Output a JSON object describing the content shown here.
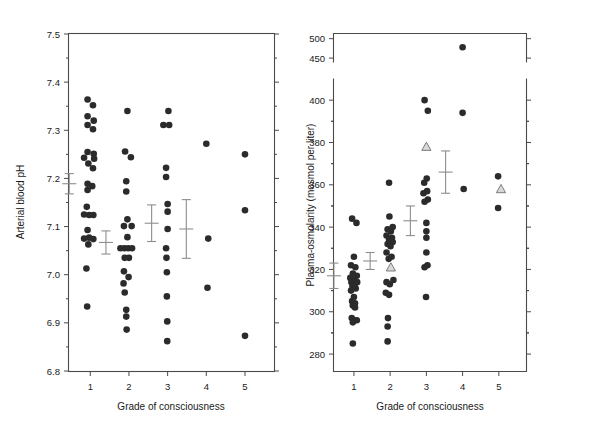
{
  "figure": {
    "caption": "",
    "panels": [
      "ph",
      "osmolarity"
    ]
  },
  "chart_data": [
    {
      "type": "scatter",
      "id": "ph",
      "title": "",
      "xlabel": "Grade of consciousness",
      "ylabel": "Arterial blood pH",
      "xlim": [
        0.45,
        5.75
      ],
      "ylim": [
        6.8,
        7.5
      ],
      "yticks": [
        6.8,
        6.9,
        7.0,
        7.1,
        7.2,
        7.3,
        7.4,
        7.5
      ],
      "ytick_labels": [
        "6.8",
        "6.9",
        "7.0",
        "7.1",
        "7.2",
        "7.3",
        "7.4",
        "7.5"
      ],
      "xticks": [
        1,
        2,
        3,
        4,
        5
      ],
      "xtick_labels": [
        "1",
        "2",
        "3",
        "4",
        "5"
      ],
      "grid": false,
      "legend": "none",
      "series": [
        {
          "name": "Grade 1",
          "marker": "filled-circle",
          "x": 1,
          "points": [
            {
              "x": 0.93,
              "y": 7.364
            },
            {
              "x": 1.07,
              "y": 7.352
            },
            {
              "x": 0.93,
              "y": 7.329
            },
            {
              "x": 1.09,
              "y": 7.32
            },
            {
              "x": 0.93,
              "y": 7.311
            },
            {
              "x": 1.07,
              "y": 7.302
            },
            {
              "x": 0.93,
              "y": 7.255
            },
            {
              "x": 1.09,
              "y": 7.251
            },
            {
              "x": 0.84,
              "y": 7.243
            },
            {
              "x": 1.1,
              "y": 7.241
            },
            {
              "x": 0.95,
              "y": 7.231
            },
            {
              "x": 1.07,
              "y": 7.221
            },
            {
              "x": 0.93,
              "y": 7.189
            },
            {
              "x": 1.05,
              "y": 7.184
            },
            {
              "x": 0.93,
              "y": 7.176
            },
            {
              "x": 0.91,
              "y": 7.141
            },
            {
              "x": 0.84,
              "y": 7.125
            },
            {
              "x": 0.97,
              "y": 7.124
            },
            {
              "x": 1.08,
              "y": 7.124
            },
            {
              "x": 0.84,
              "y": 7.075
            },
            {
              "x": 0.97,
              "y": 7.077
            },
            {
              "x": 1.08,
              "y": 7.074
            },
            {
              "x": 0.93,
              "y": 7.093
            },
            {
              "x": 0.95,
              "y": 7.063
            },
            {
              "x": 0.9,
              "y": 7.013
            },
            {
              "x": 0.92,
              "y": 6.934
            }
          ],
          "mean": 7.189,
          "sem": 0.021
        },
        {
          "name": "Grade 2",
          "marker": "filled-circle",
          "x": 2,
          "points": [
            {
              "x": 1.96,
              "y": 7.34
            },
            {
              "x": 1.9,
              "y": 7.256
            },
            {
              "x": 2.05,
              "y": 7.244
            },
            {
              "x": 1.93,
              "y": 7.194
            },
            {
              "x": 1.93,
              "y": 7.173
            },
            {
              "x": 1.96,
              "y": 7.115
            },
            {
              "x": 2.07,
              "y": 7.101
            },
            {
              "x": 1.87,
              "y": 7.101
            },
            {
              "x": 1.96,
              "y": 7.078
            },
            {
              "x": 1.78,
              "y": 7.055
            },
            {
              "x": 1.88,
              "y": 7.055
            },
            {
              "x": 1.98,
              "y": 7.055
            },
            {
              "x": 2.08,
              "y": 7.055
            },
            {
              "x": 1.89,
              "y": 7.035
            },
            {
              "x": 2.0,
              "y": 7.035
            },
            {
              "x": 1.87,
              "y": 7.007
            },
            {
              "x": 1.99,
              "y": 6.995
            },
            {
              "x": 1.86,
              "y": 6.982
            },
            {
              "x": 1.89,
              "y": 6.963
            },
            {
              "x": 1.93,
              "y": 6.927
            },
            {
              "x": 1.93,
              "y": 6.913
            },
            {
              "x": 1.94,
              "y": 6.886
            }
          ],
          "mean": 7.067,
          "sem": 0.024
        },
        {
          "name": "Grade 3",
          "marker": "filled-circle",
          "x": 3,
          "points": [
            {
              "x": 3.02,
              "y": 7.34
            },
            {
              "x": 2.89,
              "y": 7.311
            },
            {
              "x": 3.04,
              "y": 7.311
            },
            {
              "x": 2.96,
              "y": 7.222
            },
            {
              "x": 2.96,
              "y": 7.203
            },
            {
              "x": 3.0,
              "y": 7.147
            },
            {
              "x": 3.0,
              "y": 7.131
            },
            {
              "x": 3.0,
              "y": 7.095
            },
            {
              "x": 2.96,
              "y": 7.055
            },
            {
              "x": 2.97,
              "y": 7.035
            },
            {
              "x": 2.98,
              "y": 7.005
            },
            {
              "x": 2.98,
              "y": 6.955
            },
            {
              "x": 2.99,
              "y": 6.903
            },
            {
              "x": 2.99,
              "y": 6.862
            }
          ],
          "mean": 7.107,
          "sem": 0.038
        },
        {
          "name": "Grade 4",
          "marker": "filled-circle",
          "x": 4,
          "points": [
            {
              "x": 4.0,
              "y": 7.272
            },
            {
              "x": 4.05,
              "y": 7.075
            },
            {
              "x": 4.03,
              "y": 6.973
            }
          ],
          "mean": 7.095,
          "sem": 0.061
        },
        {
          "name": "Grade 5",
          "marker": "filled-circle",
          "x": 5,
          "points": [
            {
              "x": 5.0,
              "y": 7.25
            },
            {
              "x": 5.0,
              "y": 7.134
            },
            {
              "x": 5.0,
              "y": 6.873
            }
          ],
          "mean": null,
          "sem": null
        }
      ]
    },
    {
      "type": "scatter",
      "id": "osmolarity",
      "title": "",
      "xlabel": "Grade of consciousness",
      "ylabel": "Plasma-osmolarity (mosmol per liter)",
      "xlim": [
        0.45,
        5.75
      ],
      "ylim": [
        272,
        410
      ],
      "ylim_upper": [
        440,
        512
      ],
      "broken_axis": true,
      "yticks": [
        280,
        300,
        320,
        340,
        360,
        380,
        400
      ],
      "ytick_labels": [
        "280",
        "300",
        "320",
        "340",
        "360",
        "380",
        "400"
      ],
      "yticks_upper": [
        450,
        500
      ],
      "ytick_labels_upper": [
        "450",
        "500"
      ],
      "xticks": [
        1,
        2,
        3,
        4,
        5
      ],
      "xtick_labels": [
        "1",
        "2",
        "3",
        "4",
        "5"
      ],
      "grid": false,
      "legend": "none",
      "series": [
        {
          "name": "Grade 1",
          "marker": "filled-circle",
          "x": 1,
          "points": [
            {
              "x": 0.95,
              "y": 344
            },
            {
              "x": 1.07,
              "y": 342
            },
            {
              "x": 1.0,
              "y": 326
            },
            {
              "x": 0.92,
              "y": 322
            },
            {
              "x": 1.04,
              "y": 321
            },
            {
              "x": 0.97,
              "y": 318
            },
            {
              "x": 1.08,
              "y": 317
            },
            {
              "x": 0.9,
              "y": 316
            },
            {
              "x": 1.0,
              "y": 315
            },
            {
              "x": 1.09,
              "y": 314
            },
            {
              "x": 0.93,
              "y": 314
            },
            {
              "x": 1.02,
              "y": 313
            },
            {
              "x": 0.96,
              "y": 312
            },
            {
              "x": 1.05,
              "y": 311
            },
            {
              "x": 0.92,
              "y": 310
            },
            {
              "x": 1.0,
              "y": 307
            },
            {
              "x": 0.95,
              "y": 305
            },
            {
              "x": 1.03,
              "y": 304
            },
            {
              "x": 0.97,
              "y": 303
            },
            {
              "x": 1.03,
              "y": 302
            },
            {
              "x": 0.94,
              "y": 297
            },
            {
              "x": 1.01,
              "y": 296
            },
            {
              "x": 1.08,
              "y": 296
            },
            {
              "x": 0.97,
              "y": 295
            },
            {
              "x": 0.97,
              "y": 285
            }
          ],
          "mean": 317,
          "sem": 6
        },
        {
          "name": "Grade 2",
          "marker": "filled-circle",
          "x": 2,
          "points": [
            {
              "x": 1.97,
              "y": 361
            },
            {
              "x": 1.98,
              "y": 345
            },
            {
              "x": 1.93,
              "y": 339
            },
            {
              "x": 2.07,
              "y": 340
            },
            {
              "x": 2.02,
              "y": 338
            },
            {
              "x": 1.9,
              "y": 336
            },
            {
              "x": 2.05,
              "y": 335
            },
            {
              "x": 1.97,
              "y": 334
            },
            {
              "x": 2.07,
              "y": 333
            },
            {
              "x": 1.93,
              "y": 332
            },
            {
              "x": 2.01,
              "y": 331
            },
            {
              "x": 1.9,
              "y": 328
            },
            {
              "x": 2.04,
              "y": 326
            },
            {
              "x": 1.96,
              "y": 325
            },
            {
              "x": 2.09,
              "y": 315
            },
            {
              "x": 1.9,
              "y": 314
            },
            {
              "x": 1.99,
              "y": 313
            },
            {
              "x": 1.88,
              "y": 309
            },
            {
              "x": 1.97,
              "y": 308
            },
            {
              "x": 1.94,
              "y": 297
            },
            {
              "x": 1.93,
              "y": 293
            },
            {
              "x": 1.93,
              "y": 286
            }
          ],
          "mean": 324,
          "sem": 4,
          "triangles": [
            {
              "x": 2.02,
              "y": 321
            }
          ]
        },
        {
          "name": "Grade 3",
          "marker": "filled-circle",
          "x": 3,
          "points": [
            {
              "x": 2.95,
              "y": 400
            },
            {
              "x": 3.04,
              "y": 395
            },
            {
              "x": 3.01,
              "y": 363
            },
            {
              "x": 2.94,
              "y": 361
            },
            {
              "x": 2.92,
              "y": 356
            },
            {
              "x": 3.02,
              "y": 357
            },
            {
              "x": 3.04,
              "y": 353
            },
            {
              "x": 2.95,
              "y": 352
            },
            {
              "x": 3.0,
              "y": 342
            },
            {
              "x": 3.0,
              "y": 338
            },
            {
              "x": 3.0,
              "y": 335
            },
            {
              "x": 3.0,
              "y": 328
            },
            {
              "x": 2.95,
              "y": 321
            },
            {
              "x": 3.03,
              "y": 322
            },
            {
              "x": 2.99,
              "y": 307
            }
          ],
          "mean": 343,
          "sem": 7,
          "triangles": [
            {
              "x": 3.0,
              "y": 378
            }
          ]
        },
        {
          "name": "Grade 4",
          "marker": "filled-circle",
          "x": 4,
          "points": [
            {
              "x": 4.0,
              "y": 394
            },
            {
              "x": 4.03,
              "y": 358
            }
          ],
          "points_upper": [
            {
              "x": 4.0,
              "y": 478
            }
          ],
          "mean": 366,
          "sem": 10
        },
        {
          "name": "Grade 5",
          "marker": "filled-circle",
          "x": 5,
          "points": [
            {
              "x": 4.98,
              "y": 364
            },
            {
              "x": 4.98,
              "y": 349
            }
          ],
          "mean": null,
          "sem": null,
          "triangles": [
            {
              "x": 5.06,
              "y": 358
            }
          ]
        }
      ]
    }
  ]
}
